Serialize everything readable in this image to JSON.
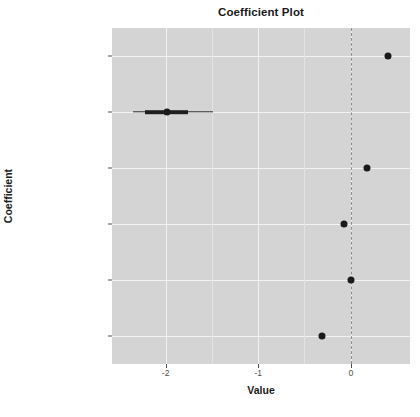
{
  "chart_data": {
    "type": "scatter",
    "title": "Coefficient Plot",
    "xlabel": "Value",
    "ylabel": "Coefficient",
    "xlim": [
      -2.58,
      0.64
    ],
    "xticks": [
      -2,
      -1,
      0
    ],
    "xtick_labels": [
      "-2",
      "-1",
      "0"
    ],
    "x_minor_ticks": [
      -1.5,
      -0.5
    ],
    "grid": true,
    "legend": false,
    "reference_line": {
      "value": 0,
      "style": "dashed",
      "color": "#8e8e8e"
    },
    "categories": [
      "OwnRentRented",
      "OwnRentOutright",
      "FamilyTypeMarried",
      "FamilyTypeMale Head",
      "FamilyIncome",
      "(Intercept)"
    ],
    "points": [
      {
        "label": "OwnRentRented",
        "value": 0.4,
        "ci_inner": [
          0.4,
          0.4
        ],
        "ci_outer": [
          0.4,
          0.4
        ]
      },
      {
        "label": "OwnRentOutright",
        "value": -1.99,
        "ci_inner": [
          -2.22,
          -1.76
        ],
        "ci_outer": [
          -2.35,
          -1.49
        ]
      },
      {
        "label": "FamilyTypeMarried",
        "value": 0.17,
        "ci_inner": [
          0.17,
          0.17
        ],
        "ci_outer": [
          0.17,
          0.17
        ]
      },
      {
        "label": "FamilyTypeMale Head",
        "value": -0.07,
        "ci_inner": [
          -0.07,
          -0.07
        ],
        "ci_outer": [
          -0.07,
          -0.07
        ]
      },
      {
        "label": "FamilyIncome",
        "value": 0.0,
        "ci_inner": [
          0.0,
          0.0
        ],
        "ci_outer": [
          0.0,
          0.0
        ]
      },
      {
        "label": "(Intercept)",
        "value": -0.31,
        "ci_inner": [
          -0.31,
          -0.31
        ],
        "ci_outer": [
          -0.31,
          -0.31
        ]
      }
    ],
    "point_color": "#1a1a1a",
    "panel_background": "#d4d4d4",
    "gridline_color": "#f2f2f2"
  }
}
